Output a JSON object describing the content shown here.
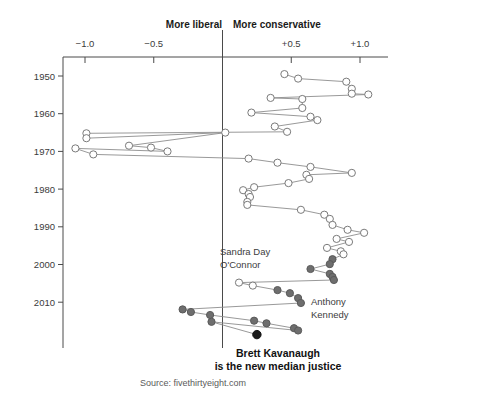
{
  "chart_data": {
    "type": "line",
    "title": "",
    "subtitle": "",
    "xlabel": "Martin-Quinn ideology score",
    "ylabel": "Year",
    "xlim": [
      -1.35,
      1.2
    ],
    "ylim": [
      1947,
      2019
    ],
    "grid": false,
    "legend_position": "none",
    "axis_headers": {
      "left": "More liberal",
      "right": "More conservative"
    },
    "x_ticks": [
      {
        "value": -1.0,
        "label": "−1.0"
      },
      {
        "value": -0.5,
        "label": "−0.5"
      },
      {
        "value": 0.5,
        "label": "+0.5"
      },
      {
        "value": 1.0,
        "label": "+1.0"
      }
    ],
    "y_ticks": [
      {
        "value": 1950,
        "label": "1950"
      },
      {
        "value": 1960,
        "label": "1960"
      },
      {
        "value": 1970,
        "label": "1970"
      },
      {
        "value": 1980,
        "label": "1980"
      },
      {
        "value": 1990,
        "label": "1990"
      },
      {
        "value": 2000,
        "label": "2000"
      },
      {
        "value": 2010,
        "label": "2010"
      }
    ],
    "center_reference": 0,
    "series": [
      {
        "name": "median-justice-ideology",
        "description": "Martin-Quinn score of the median Supreme Court justice by year",
        "points": [
          {
            "year": 1949.5,
            "score": 0.45,
            "style": "open"
          },
          {
            "year": 1950.7,
            "score": 0.55,
            "style": "open"
          },
          {
            "year": 1951.5,
            "score": 0.9,
            "style": "open"
          },
          {
            "year": 1953.4,
            "score": 0.94,
            "style": "open"
          },
          {
            "year": 1954.7,
            "score": 0.94,
            "style": "open"
          },
          {
            "year": 1954.9,
            "score": 1.06,
            "style": "open"
          },
          {
            "year": 1955.8,
            "score": 0.35,
            "style": "open"
          },
          {
            "year": 1956.1,
            "score": 0.58,
            "style": "open"
          },
          {
            "year": 1958.5,
            "score": 0.58,
            "style": "open"
          },
          {
            "year": 1959.7,
            "score": 0.21,
            "style": "open"
          },
          {
            "year": 1960.8,
            "score": 0.64,
            "style": "open"
          },
          {
            "year": 1961.7,
            "score": 0.69,
            "style": "open"
          },
          {
            "year": 1963.4,
            "score": 0.38,
            "style": "open"
          },
          {
            "year": 1964.8,
            "score": 0.47,
            "style": "open"
          },
          {
            "year": 1965.2,
            "score": -0.99,
            "style": "open"
          },
          {
            "year": 1966.5,
            "score": -0.99,
            "style": "open"
          },
          {
            "year": 1965.0,
            "score": 0.02,
            "style": "open"
          },
          {
            "year": 1968.5,
            "score": -0.68,
            "style": "open"
          },
          {
            "year": 1969.0,
            "score": -0.52,
            "style": "open"
          },
          {
            "year": 1970.0,
            "score": -0.4,
            "style": "open"
          },
          {
            "year": 1969.2,
            "score": -1.07,
            "style": "open"
          },
          {
            "year": 1970.8,
            "score": -0.94,
            "style": "open"
          },
          {
            "year": 1971.9,
            "score": 0.19,
            "style": "open"
          },
          {
            "year": 1973.0,
            "score": 0.4,
            "style": "open"
          },
          {
            "year": 1974.1,
            "score": 0.64,
            "style": "open"
          },
          {
            "year": 1975.7,
            "score": 0.94,
            "style": "open"
          },
          {
            "year": 1976.2,
            "score": 0.61,
            "style": "open"
          },
          {
            "year": 1977.3,
            "score": 0.63,
            "style": "open"
          },
          {
            "year": 1978.4,
            "score": 0.48,
            "style": "open"
          },
          {
            "year": 1979.5,
            "score": 0.23,
            "style": "open"
          },
          {
            "year": 1980.3,
            "score": 0.15,
            "style": "open"
          },
          {
            "year": 1981.3,
            "score": 0.19,
            "style": "open"
          },
          {
            "year": 1982.1,
            "score": 0.2,
            "style": "open"
          },
          {
            "year": 1983.4,
            "score": 0.18,
            "style": "open"
          },
          {
            "year": 1984.2,
            "score": 0.18,
            "style": "open"
          },
          {
            "year": 1985.5,
            "score": 0.57,
            "style": "open"
          },
          {
            "year": 1986.8,
            "score": 0.74,
            "style": "open"
          },
          {
            "year": 1987.9,
            "score": 0.78,
            "style": "open"
          },
          {
            "year": 1989.5,
            "score": 0.8,
            "style": "open"
          },
          {
            "year": 1990.8,
            "score": 0.91,
            "style": "open"
          },
          {
            "year": 1991.6,
            "score": 1.03,
            "style": "open"
          },
          {
            "year": 1993.2,
            "score": 0.83,
            "style": "open"
          },
          {
            "year": 1994.0,
            "score": 0.92,
            "style": "open"
          },
          {
            "year": 1995.6,
            "score": 0.76,
            "style": "open"
          },
          {
            "year": 1996.5,
            "score": 0.86,
            "style": "open"
          },
          {
            "year": 1997.3,
            "score": 0.88,
            "style": "open"
          },
          {
            "year": 1998.6,
            "score": 0.8,
            "style": "filled"
          },
          {
            "year": 1999.9,
            "score": 0.78,
            "style": "filled"
          },
          {
            "year": 2001.2,
            "score": 0.64,
            "style": "filled"
          },
          {
            "year": 2002.5,
            "score": 0.78,
            "style": "filled"
          },
          {
            "year": 2003.3,
            "score": 0.8,
            "style": "filled"
          },
          {
            "year": 2004.1,
            "score": 0.81,
            "style": "filled"
          },
          {
            "year": 2004.8,
            "score": 0.12,
            "style": "open"
          },
          {
            "year": 2005.6,
            "score": 0.22,
            "style": "open"
          },
          {
            "year": 2006.8,
            "score": 0.4,
            "style": "filled"
          },
          {
            "year": 2007.6,
            "score": 0.49,
            "style": "filled"
          },
          {
            "year": 2008.9,
            "score": 0.55,
            "style": "filled"
          },
          {
            "year": 2010.2,
            "score": 0.57,
            "style": "filled"
          },
          {
            "year": 2011.9,
            "score": -0.29,
            "style": "filled"
          },
          {
            "year": 2012.6,
            "score": -0.23,
            "style": "filled"
          },
          {
            "year": 2013.4,
            "score": -0.09,
            "style": "filled"
          },
          {
            "year": 2014.9,
            "score": 0.23,
            "style": "filled"
          },
          {
            "year": 2015.6,
            "score": 0.32,
            "style": "filled"
          },
          {
            "year": 2016.9,
            "score": 0.52,
            "style": "filled"
          },
          {
            "year": 2017.5,
            "score": 0.55,
            "style": "filled"
          },
          {
            "year": 2015.2,
            "score": -0.08,
            "style": "filled"
          },
          {
            "year": 2018.6,
            "score": 0.25,
            "style": "black"
          }
        ]
      }
    ],
    "annotations": [
      {
        "name": "sandra-day-oconnor",
        "lines": [
          "Sandra Day",
          "O'Connor"
        ],
        "x": 220,
        "y": 255,
        "bold": false
      },
      {
        "name": "anthony-kennedy",
        "lines": [
          "Anthony",
          "Kennedy"
        ],
        "x": 311,
        "y": 305,
        "bold": false
      },
      {
        "name": "brett-kavanaugh-callout",
        "lines": [
          "Brett Kavanaugh",
          "is the new median justice"
        ],
        "x": 278,
        "y": 357,
        "bold": true
      }
    ],
    "source": "Source: fivethirtyeight.com",
    "colors": {
      "axis": "#4a4a4a",
      "line": "#8d8d8d",
      "point_open_fill": "#ffffff",
      "point_open_stroke": "#7a7a7a",
      "point_filled": "#6e6e6e",
      "point_highlight": "#1a1a1a",
      "background": "#ffffff",
      "text": "#222222"
    }
  }
}
